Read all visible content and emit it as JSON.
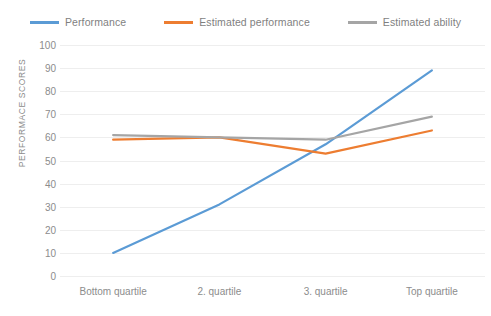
{
  "chart_data": {
    "type": "line",
    "title": "",
    "xlabel": "",
    "ylabel": "PERFORMACE SCORES",
    "categories": [
      "Bottom quartile",
      "2. quartile",
      "3. quartile",
      "Top quartile"
    ],
    "ylim": [
      0,
      100
    ],
    "ytick_values": [
      100,
      90,
      80,
      70,
      60,
      50,
      40,
      30,
      20,
      10,
      0
    ],
    "ytick_labels": [
      "100",
      "90",
      "80",
      "70",
      "60",
      "50",
      "40",
      "30",
      "20",
      "10",
      "0"
    ],
    "grid": true,
    "legend_position": "top-center",
    "series": [
      {
        "name": "Performance",
        "color": "#5B9BD5",
        "values": [
          10,
          31,
          57,
          89
        ]
      },
      {
        "name": "Estimated performance",
        "color": "#ED7D31",
        "values": [
          59,
          60,
          53,
          63
        ]
      },
      {
        "name": "Estimated ability",
        "color": "#A5A5A5",
        "values": [
          61,
          60,
          59,
          69
        ]
      }
    ]
  },
  "legend": {
    "items": [
      {
        "label": "Performance",
        "color": "#5B9BD5"
      },
      {
        "label": "Estimated performance",
        "color": "#ED7D31"
      },
      {
        "label": "Estimated ability",
        "color": "#A5A5A5"
      }
    ]
  },
  "colors": {
    "performance": "#5B9BD5",
    "estimated_performance": "#ED7D31",
    "estimated_ability": "#A5A5A5",
    "text": "#8c8c8c",
    "gridline": "#eeeeee",
    "background": "#ffffff"
  }
}
